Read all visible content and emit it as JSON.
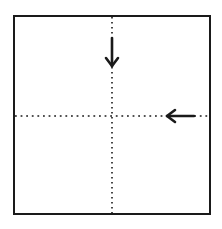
{
  "diagram": {
    "type": "folding-diagram",
    "paper": {
      "x": 14,
      "y": 16,
      "width": 196,
      "height": 198,
      "stroke": "#1a1a1a"
    },
    "fold_lines": [
      {
        "id": "vertical-center",
        "orientation": "vertical",
        "style": "dotted",
        "x": 112,
        "y1": 16,
        "y2": 214
      },
      {
        "id": "horizontal-center",
        "orientation": "horizontal",
        "style": "dotted",
        "y": 116,
        "x1": 14,
        "x2": 210
      }
    ],
    "arrows": [
      {
        "id": "arrow-down",
        "direction": "down",
        "x": 112,
        "y_from": 38,
        "y_to": 67
      },
      {
        "id": "arrow-left",
        "direction": "left",
        "y": 116,
        "x_from": 195,
        "x_to": 166
      }
    ],
    "colors": {
      "line": "#1a1a1a",
      "background": "#ffffff"
    }
  }
}
